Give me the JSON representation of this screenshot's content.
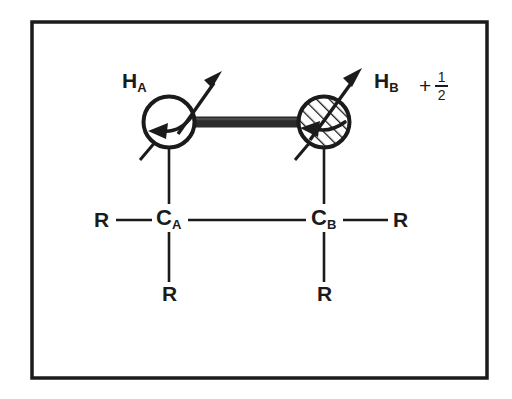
{
  "figure": {
    "type": "chemical-structure-diagram",
    "topic": "nuclear spin coupling between two vicinal protons",
    "background_color": "#ffffff",
    "ink_color": "#1b1b1b",
    "border": {
      "name": "figure-frame",
      "x": 32,
      "y": 22,
      "width": 455,
      "height": 356,
      "stroke_width": 3.5,
      "color": "#1b1b1b"
    },
    "labels": {
      "h_a": {
        "text": "H",
        "sub": "A",
        "x": 122,
        "y": 72
      },
      "h_b": {
        "text": "H",
        "sub": "B",
        "x": 374,
        "y": 72
      },
      "spin_sign": "+",
      "spin_numerator": "1",
      "spin_denominator": "2",
      "c_a": {
        "text": "C",
        "sub": "A",
        "x": 156,
        "y": 208
      },
      "c_b": {
        "text": "C",
        "sub": "B",
        "x": 311,
        "y": 208
      },
      "r_left": {
        "text": "R",
        "x": 94,
        "y": 208
      },
      "r_right": {
        "text": "R",
        "x": 393,
        "y": 208
      },
      "r_bottom_left": {
        "text": "R",
        "x": 162,
        "y": 283
      },
      "r_bottom_right": {
        "text": "R",
        "x": 317,
        "y": 283
      }
    },
    "atoms": {
      "proton_a": {
        "name": "proton-a-circle",
        "cx": 169,
        "cy": 122,
        "r": 27,
        "fill": "#ffffff",
        "hatched": false,
        "stroke_width": 4
      },
      "proton_b": {
        "name": "proton-b-circle",
        "cx": 324,
        "cy": 122,
        "r": 27,
        "fill": "#ffffff",
        "hatched": true,
        "hatch_angle_deg": 45,
        "stroke_width": 4
      }
    },
    "bonds": {
      "coupling_bar": {
        "name": "coupling-bond-bar",
        "x1": 193,
        "x2": 300,
        "y": 122,
        "thickness": 11,
        "color": "#262626"
      },
      "skeleton_y": 220,
      "ca_x": 169,
      "cb_x": 324
    },
    "spin_arrows": {
      "magnetic_moment_a": {
        "x1": 180,
        "y1": 132,
        "x2": 222,
        "y2": 72
      },
      "magnetic_moment_b": {
        "x1": 315,
        "y1": 132,
        "x2": 362,
        "y2": 70
      },
      "precession_a_direction": "left",
      "precession_b_direction": "left"
    }
  }
}
